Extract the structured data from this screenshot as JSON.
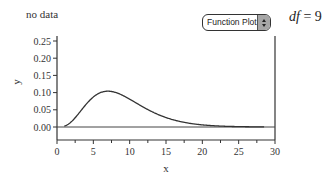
{
  "status_text": "no data",
  "dropdown": {
    "selected": "Function Plot"
  },
  "df_label": {
    "var": "df",
    "eq": " = ",
    "value": "9"
  },
  "chart_data": {
    "type": "line",
    "title": "",
    "xlabel": "x",
    "ylabel": "y",
    "xlim": [
      0,
      30
    ],
    "ylim": [
      -0.04,
      0.27
    ],
    "xticks": [
      0,
      5,
      10,
      15,
      20,
      25,
      30
    ],
    "xtick_labels": [
      "0",
      "5",
      "10",
      "15",
      "20",
      "25",
      "30"
    ],
    "xminor_ticks": [
      2.5,
      7.5,
      12.5,
      17.5,
      22.5,
      27.5
    ],
    "yticks": [
      0.0,
      0.05,
      0.1,
      0.15,
      0.2,
      0.25
    ],
    "ytick_labels": [
      "0.00",
      "0.05",
      "0.10",
      "0.15",
      "0.20",
      "0.25"
    ],
    "grid": false,
    "hline": 0,
    "series": [
      {
        "name": "chi-square density (df = 9)",
        "function": "chisq_pdf",
        "df": 9,
        "x_range": [
          1,
          28.5
        ],
        "color": "#333333"
      }
    ]
  }
}
